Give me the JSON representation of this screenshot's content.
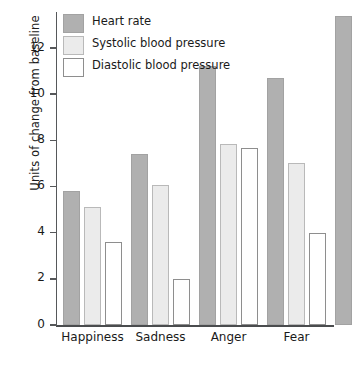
{
  "chart_data": {
    "type": "bar",
    "title": "",
    "xlabel": "",
    "ylabel": "Units of change from baseline",
    "categories": [
      "Happiness",
      "Sadness",
      "Anger",
      "Fear"
    ],
    "series": [
      {
        "name": "Heart rate",
        "key": "hr",
        "color": "#b0b0b0",
        "values": [
          5.8,
          7.4,
          11.2,
          10.7
        ]
      },
      {
        "name": "Systolic blood pressure",
        "key": "sys",
        "color": "#ebebeb",
        "values": [
          5.1,
          6.05,
          7.85,
          7.0
        ]
      },
      {
        "name": "Diastolic blood pressure",
        "key": "dia",
        "color": "#ffffff",
        "values": [
          3.6,
          2.0,
          7.65,
          4.0
        ]
      }
    ],
    "ylim": [
      0,
      13.4
    ],
    "yticks": [
      0,
      2,
      4,
      6,
      8,
      10,
      12
    ],
    "ytick_labels": [
      "0",
      "2",
      "4",
      "6",
      "8",
      "10",
      "12"
    ],
    "grid": false,
    "legend_position": "top-left",
    "legend_entries": [
      {
        "label": "Heart rate",
        "swatch": "series-hr"
      },
      {
        "label": "Systolic blood pressure",
        "swatch": "series-sys"
      },
      {
        "label": "Diastolic blood pressure",
        "swatch": "series-dia"
      }
    ],
    "clipped_group": {
      "note": "partial fifth group bar clipped at right edge",
      "series": "Heart rate",
      "value": 13.4
    }
  },
  "colors": {
    "heart_rate": "#b0b0b0",
    "systolic": "#ebebeb",
    "diastolic": "#ffffff",
    "axis": "#4a4c4e",
    "text": "#1a1a1a",
    "background": "#ffffff"
  }
}
